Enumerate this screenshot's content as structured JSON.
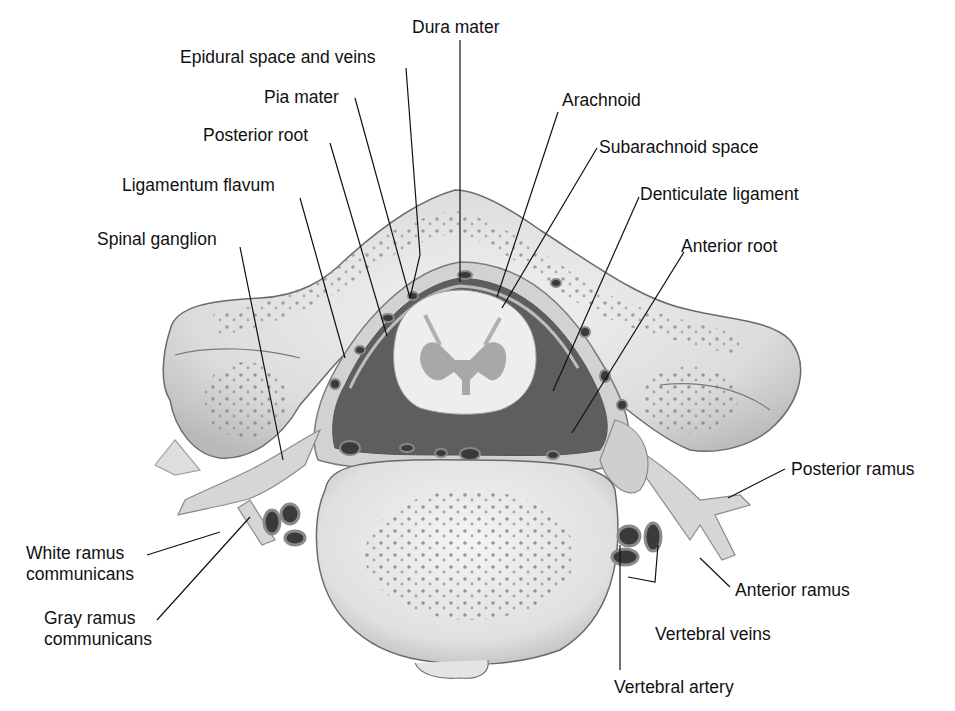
{
  "figure": {
    "type": "anatomical-diagram"
  },
  "labels": {
    "dura_mater": "Dura mater",
    "epidural": "Epidural space and veins",
    "pia_mater": "Pia mater",
    "posterior_root": "Posterior root",
    "ligamentum_flavum": "Ligamentum flavum",
    "spinal_ganglion": "Spinal ganglion",
    "arachnoid": "Arachnoid",
    "subarachnoid": "Subarachnoid space",
    "denticulate": "Denticulate ligament",
    "anterior_root": "Anterior root",
    "posterior_ramus": "Posterior ramus",
    "white_ramus_1": "White ramus",
    "white_ramus_2": "communicans",
    "gray_ramus_1": "Gray ramus",
    "gray_ramus_2": "communicans",
    "anterior_ramus": "Anterior ramus",
    "vertebral_veins": "Vertebral veins",
    "vertebral_artery": "Vertebral artery"
  },
  "colors": {
    "bone": "#dedede",
    "bone_edge": "#6a6a6a",
    "cord": "#eeeeee",
    "gray_matter": "#a8a8a8",
    "dark_space": "#5e5e5e",
    "vessel": "#3a3a3a",
    "leader": "#111111"
  }
}
